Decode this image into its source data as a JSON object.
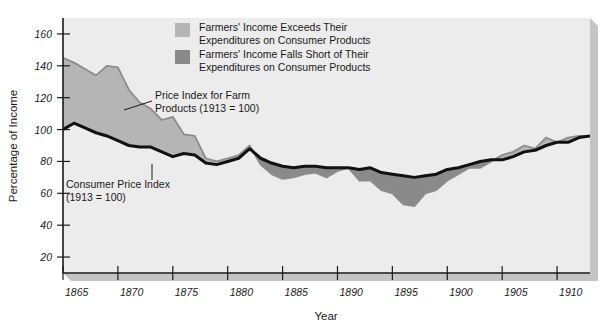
{
  "chart_data": {
    "type": "area",
    "title": "",
    "xlabel": "Year",
    "ylabel": "Percentage of Income",
    "xlim": [
      1865,
      1913
    ],
    "ylim": [
      10,
      170
    ],
    "yticks": [
      20,
      40,
      60,
      80,
      100,
      120,
      140,
      160
    ],
    "xticks": [
      1865,
      1870,
      1875,
      1880,
      1885,
      1890,
      1895,
      1900,
      1905,
      1910
    ],
    "grid": false,
    "legend_position": "top-center",
    "x": [
      1865,
      1866,
      1867,
      1868,
      1869,
      1870,
      1871,
      1872,
      1873,
      1874,
      1875,
      1876,
      1877,
      1878,
      1879,
      1880,
      1881,
      1882,
      1883,
      1884,
      1885,
      1886,
      1887,
      1888,
      1889,
      1890,
      1891,
      1892,
      1893,
      1894,
      1895,
      1896,
      1897,
      1898,
      1899,
      1900,
      1901,
      1902,
      1903,
      1904,
      1905,
      1906,
      1907,
      1908,
      1909,
      1910,
      1911,
      1912,
      1913
    ],
    "series": [
      {
        "name": "Price Index for Farm Products (1913 = 100)",
        "color": "#8c8c8c",
        "values": [
          145,
          142,
          138,
          134,
          140,
          139,
          125,
          117,
          113,
          106,
          108,
          97,
          96,
          82,
          80,
          82,
          84,
          90,
          78,
          72,
          69,
          70,
          72,
          73,
          70,
          74,
          76,
          68,
          68,
          62,
          60,
          53,
          52,
          60,
          62,
          68,
          72,
          76,
          76,
          80,
          84,
          86,
          90,
          88,
          95,
          92,
          95,
          96,
          96
        ]
      },
      {
        "name": "Consumer Price Index (1913 = 100)",
        "color": "#111111",
        "values": [
          100,
          104,
          101,
          98,
          96,
          93,
          90,
          89,
          89,
          86,
          83,
          85,
          84,
          79,
          78,
          80,
          82,
          88,
          82,
          79,
          77,
          76,
          77,
          77,
          76,
          76,
          76,
          75,
          76,
          73,
          72,
          71,
          70,
          71,
          72,
          75,
          76,
          78,
          80,
          81,
          81,
          83,
          86,
          87,
          90,
          92,
          92,
          95,
          96
        ]
      }
    ],
    "fill_rules": {
      "above_label": "Farmers' Income Exceeds Their Expenditures on Consumer Products",
      "above_color": "#b5b5b5",
      "below_label": "Farmers' Income Falls Short of Their Expenditures on Consumer Products",
      "below_color": "#8a8a8a"
    }
  },
  "legend": {
    "items": [
      {
        "swatch_color": "#b5b5b5",
        "line1": "Farmers' Income Exceeds Their",
        "line2": "Expenditures on Consumer Products"
      },
      {
        "swatch_color": "#8a8a8a",
        "line1": "Farmers' Income Falls Short of Their",
        "line2": "Expenditures on Consumer Products"
      }
    ]
  },
  "annotations": [
    {
      "name": "farm-price-index",
      "line1": "Price Index for Farm",
      "line2": "Products (1913 = 100)"
    },
    {
      "name": "consumer-price-index",
      "line1": "Consumer Price Index",
      "line2": "(1913 = 100)"
    }
  ],
  "axes": {
    "ylabel": "Percentage of Income",
    "xlabel": "Year",
    "yticks": [
      "160",
      "140",
      "120",
      "100",
      "80",
      "60",
      "40",
      "20"
    ],
    "xticks": [
      "1865",
      "1870",
      "1875",
      "1880",
      "1885",
      "1890",
      "1895",
      "1900",
      "1905",
      "1910"
    ]
  },
  "colors": {
    "plot_background": "#ececec",
    "page_background": "#ffffff",
    "axis": "#1a1a1a",
    "shadow": "#c4c4c4"
  }
}
